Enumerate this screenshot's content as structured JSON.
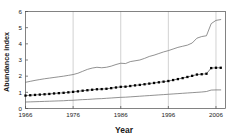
{
  "chart_data": {
    "type": "line",
    "title": "",
    "xlabel": "Year",
    "ylabel": "Abundance index",
    "xlim": [
      1966,
      2008
    ],
    "ylim": [
      0,
      6
    ],
    "grid": "vertical-only",
    "legend": "none",
    "xticks": [
      1966,
      1976,
      1986,
      1996,
      2006
    ],
    "xtick_labels": [
      "1966",
      "1976",
      "1986",
      "1996",
      "2006"
    ],
    "yticks": [
      0,
      1,
      2,
      3,
      4,
      5,
      6
    ],
    "ytick_labels": [
      "0",
      "1",
      "2",
      "3",
      "4",
      "5",
      "6"
    ],
    "x": [
      1966,
      1967,
      1968,
      1969,
      1970,
      1971,
      1972,
      1973,
      1974,
      1975,
      1976,
      1977,
      1978,
      1979,
      1980,
      1981,
      1982,
      1983,
      1984,
      1985,
      1986,
      1987,
      1988,
      1989,
      1990,
      1991,
      1992,
      1993,
      1994,
      1995,
      1996,
      1997,
      1998,
      1999,
      2000,
      2001,
      2002,
      2003,
      2004,
      2005,
      2006,
      2007
    ],
    "series": [
      {
        "name": "Upper confidence limit",
        "style": "thin-line",
        "color": "#6e6e6e",
        "marker": "none",
        "values": [
          1.62,
          1.68,
          1.74,
          1.79,
          1.84,
          1.88,
          1.92,
          1.96,
          2.0,
          2.05,
          2.1,
          2.18,
          2.3,
          2.42,
          2.5,
          2.55,
          2.52,
          2.55,
          2.62,
          2.72,
          2.8,
          2.78,
          2.9,
          2.95,
          3.0,
          3.1,
          3.22,
          3.3,
          3.4,
          3.5,
          3.58,
          3.68,
          3.78,
          3.85,
          3.92,
          4.05,
          4.35,
          4.45,
          4.5,
          5.25,
          5.45,
          5.5
        ]
      },
      {
        "name": "Abundance index (mean)",
        "style": "dotted-markers",
        "color": "#000000",
        "marker": "square",
        "values": [
          0.8,
          0.82,
          0.84,
          0.86,
          0.88,
          0.9,
          0.93,
          0.95,
          0.97,
          1.0,
          1.03,
          1.06,
          1.1,
          1.13,
          1.16,
          1.19,
          1.2,
          1.22,
          1.26,
          1.3,
          1.34,
          1.35,
          1.39,
          1.43,
          1.46,
          1.5,
          1.54,
          1.58,
          1.62,
          1.66,
          1.7,
          1.76,
          1.82,
          1.88,
          1.95,
          2.02,
          2.1,
          2.12,
          2.15,
          2.5,
          2.52,
          2.52
        ]
      },
      {
        "name": "Lower confidence limit",
        "style": "thin-line",
        "color": "#6e6e6e",
        "marker": "none",
        "values": [
          0.4,
          0.41,
          0.42,
          0.43,
          0.44,
          0.45,
          0.46,
          0.47,
          0.48,
          0.5,
          0.51,
          0.53,
          0.55,
          0.56,
          0.58,
          0.6,
          0.61,
          0.63,
          0.65,
          0.67,
          0.69,
          0.7,
          0.72,
          0.74,
          0.76,
          0.78,
          0.8,
          0.82,
          0.84,
          0.86,
          0.88,
          0.9,
          0.92,
          0.94,
          0.96,
          0.98,
          1.0,
          1.02,
          1.05,
          1.14,
          1.15,
          1.15
        ]
      }
    ]
  }
}
